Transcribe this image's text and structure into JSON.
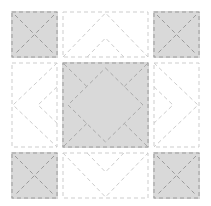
{
  "canvas": {
    "width": 211,
    "height": 206,
    "background": "#ffffff"
  },
  "palette": {
    "patch_gray": "#d9d9d9",
    "patch_white": "#ffffff",
    "stitch_dark": "#9a9a9a",
    "stitch_mid": "#a9a9a9",
    "stitch_light": "#cdcdcd"
  },
  "stitch_style": {
    "dash": "4 3",
    "width": 1
  },
  "motif_params": {
    "cross_inset": 4,
    "border_inset": 1,
    "chevron_peak_inset": 2,
    "chevron_echo_offset": 25,
    "diamond_inset": 6,
    "corner_ray_fraction": 0.57
  },
  "cells": [
    {
      "id": "corner-top-left",
      "x": 11,
      "y": 11,
      "w": 47,
      "h": 47,
      "fill": "gray",
      "motif": "diagonal-cross"
    },
    {
      "id": "edge-top",
      "x": 62,
      "y": 11,
      "w": 87,
      "h": 47,
      "fill": "white",
      "motif": "double-chevron",
      "direction": "up"
    },
    {
      "id": "corner-top-right",
      "x": 153,
      "y": 11,
      "w": 47,
      "h": 47,
      "fill": "gray",
      "motif": "diagonal-cross"
    },
    {
      "id": "edge-left",
      "x": 11,
      "y": 62,
      "w": 47,
      "h": 86,
      "fill": "white",
      "motif": "double-chevron",
      "direction": "left"
    },
    {
      "id": "center-square",
      "x": 62,
      "y": 62,
      "w": 87,
      "h": 86,
      "fill": "gray",
      "motif": "diamond-echo"
    },
    {
      "id": "edge-right",
      "x": 153,
      "y": 62,
      "w": 47,
      "h": 86,
      "fill": "white",
      "motif": "double-chevron",
      "direction": "right"
    },
    {
      "id": "corner-bottom-left",
      "x": 11,
      "y": 152,
      "w": 47,
      "h": 47,
      "fill": "gray",
      "motif": "diagonal-cross"
    },
    {
      "id": "edge-bottom",
      "x": 62,
      "y": 152,
      "w": 87,
      "h": 47,
      "fill": "white",
      "motif": "double-chevron",
      "direction": "down"
    },
    {
      "id": "corner-bottom-right",
      "x": 153,
      "y": 152,
      "w": 47,
      "h": 47,
      "fill": "gray",
      "motif": "diagonal-cross"
    }
  ]
}
